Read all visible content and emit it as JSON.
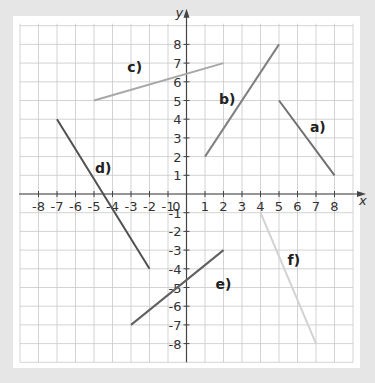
{
  "chart_data": {
    "type": "line",
    "title": "",
    "xlabel": "x",
    "ylabel": "y",
    "xlim": [
      -9,
      9
    ],
    "ylim": [
      -9,
      9
    ],
    "grid": true,
    "x_ticks": [
      "-8",
      "-7",
      "-6",
      "-5",
      "-4",
      "-3",
      "-2",
      "-1",
      "0",
      "1",
      "2",
      "3",
      "4",
      "5",
      "6",
      "7",
      "8"
    ],
    "y_ticks": [
      "8",
      "7",
      "6",
      "5",
      "4",
      "3",
      "2",
      "1",
      "-1",
      "-2",
      "-3",
      "-4",
      "-5",
      "-6",
      "-7",
      "-8"
    ],
    "series": [
      {
        "name": "a)",
        "points": [
          [
            5,
            5
          ],
          [
            8,
            1
          ]
        ],
        "color": "#707070"
      },
      {
        "name": "b)",
        "points": [
          [
            1,
            2
          ],
          [
            5,
            8
          ]
        ],
        "color": "#808080"
      },
      {
        "name": "c)",
        "points": [
          [
            -5,
            5
          ],
          [
            2,
            7
          ]
        ],
        "color": "#a8a8a8"
      },
      {
        "name": "d)",
        "points": [
          [
            -7,
            4
          ],
          [
            -2,
            -4
          ]
        ],
        "color": "#505050"
      },
      {
        "name": "e)",
        "points": [
          [
            -3,
            -7
          ],
          [
            2,
            -3
          ]
        ],
        "color": "#606060"
      },
      {
        "name": "f)",
        "points": [
          [
            4,
            -1
          ],
          [
            7,
            -8
          ]
        ],
        "color": "#d2d2d2"
      }
    ]
  }
}
